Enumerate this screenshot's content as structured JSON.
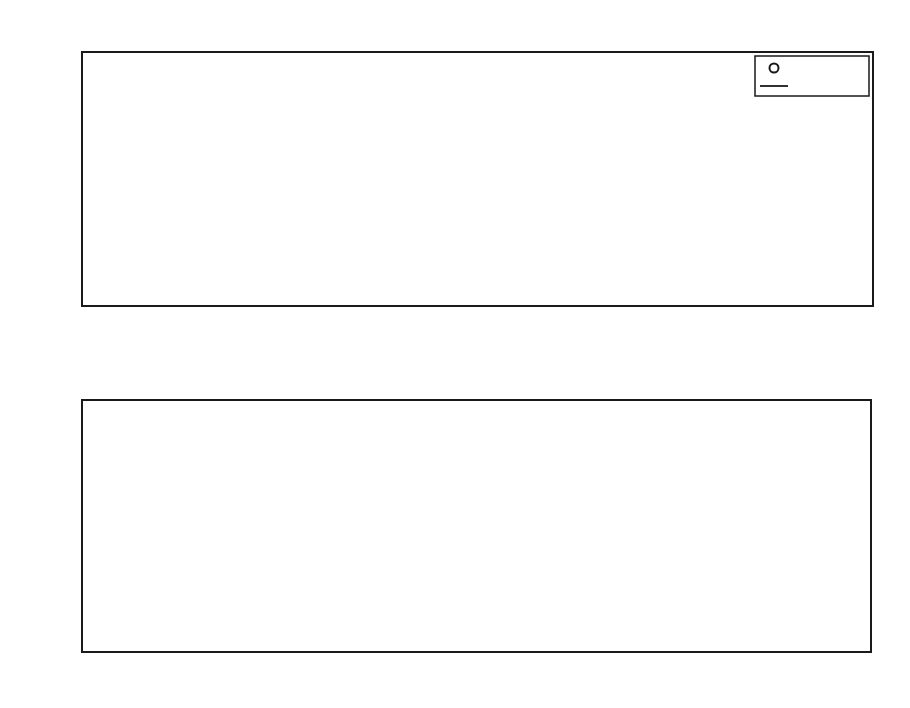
{
  "page": {
    "header": "124    CHAPTER 6   REGRESSION AND INTERPOLATION"
  },
  "chart_data": [
    {
      "type": "line",
      "title": "Kinematic viscosity of fresh water",
      "xlabel": "Temperature, degrees Celsius",
      "ylabel": "Kinematic viscosity, m² s⁻¹",
      "xlim": [
        0,
        30
      ],
      "ylim": [
        0.6,
        2
      ],
      "xticks": [
        0,
        5,
        10,
        15,
        20,
        25,
        30
      ],
      "yticks": [
        0.6,
        0.8,
        1,
        1.2,
        1.4,
        1.6,
        1.8,
        2
      ],
      "ytick_labels": [
        "0.6",
        "0.8",
        "1",
        "1.2",
        "1.4",
        "1.6",
        "1.8",
        "2"
      ],
      "grid": false,
      "legend_position": "upper right",
      "legend": [
        "data 1",
        "cubic"
      ],
      "series": [
        {
          "name": "data 1",
          "style": "circle markers",
          "x": [
            0,
            1,
            2,
            3,
            4,
            5,
            6,
            7,
            8,
            9,
            10,
            11,
            12,
            13,
            14,
            15,
            16,
            17,
            18,
            19,
            20,
            21,
            22,
            23,
            24,
            25,
            26,
            27,
            28
          ],
          "values": [
            1.787,
            1.731,
            1.674,
            1.619,
            1.568,
            1.519,
            1.472,
            1.428,
            1.386,
            1.335,
            1.307,
            1.27,
            1.235,
            1.201,
            1.169,
            1.139,
            1.109,
            1.081,
            1.053,
            1.027,
            1.002,
            0.978,
            0.955,
            0.933,
            0.911,
            0.893,
            0.873,
            0.854,
            0.836
          ]
        },
        {
          "name": "cubic",
          "style": "solid line",
          "x": [
            0,
            5,
            10,
            15,
            20,
            25,
            30
          ],
          "values": [
            1.78,
            1.515,
            1.305,
            1.137,
            1.0,
            0.887,
            0.79
          ]
        }
      ]
    },
    {
      "type": "bar",
      "title": "residuals",
      "xlabel": "",
      "ylabel": "",
      "xlim": [
        -0.4,
        28.3
      ],
      "ylim": [
        -0.15,
        0.15
      ],
      "xticks": [
        0,
        5,
        10,
        15,
        20,
        25
      ],
      "yticks": [
        -0.1,
        -0.05,
        0,
        0.05,
        0.1
      ],
      "ytick_labels": [
        "−0.1",
        "−0.05",
        "0",
        "0.05",
        "0.1"
      ],
      "grid": false,
      "categories": [
        0,
        1,
        2,
        3,
        4,
        5,
        6,
        7,
        8,
        9,
        10,
        11,
        12,
        13,
        14,
        15,
        16,
        17,
        18,
        19,
        20,
        21,
        22,
        23,
        24,
        25,
        26,
        27,
        28
      ],
      "values": [
        0.001,
        0.0,
        -0.002,
        0.0,
        0.001,
        0.001,
        -0.001,
        0.001,
        0.003,
        -0.008,
        0.002,
        0.0,
        0.003,
        0.0,
        0.0,
        0.0,
        0.0,
        -0.001,
        0.001,
        -0.001,
        0.001,
        0.0,
        0.0,
        0.0,
        0.0,
        0.0,
        0.0,
        0.0,
        0.001
      ]
    }
  ]
}
